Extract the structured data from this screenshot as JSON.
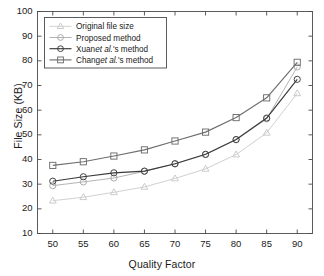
{
  "chart_data": {
    "type": "line",
    "title": "",
    "xlabel": "Quality Factor",
    "ylabel": "File Size (KB)",
    "x": [
      50,
      55,
      60,
      65,
      70,
      75,
      80,
      85,
      90
    ],
    "xticks": [
      "50",
      "55",
      "60",
      "65",
      "70",
      "75",
      "80",
      "85",
      "90"
    ],
    "yticks": [
      "10",
      "20",
      "30",
      "40",
      "50",
      "60",
      "70",
      "80",
      "90",
      "100"
    ],
    "xlim": [
      47.5,
      92.5
    ],
    "ylim": [
      10,
      100
    ],
    "grid": false,
    "legend_position": "upper-left-inside",
    "series": [
      {
        "name": "Original file size",
        "marker": "triangle",
        "color": "#c8c8c8",
        "values": [
          23.3,
          24.7,
          26.7,
          28.9,
          32.3,
          36.2,
          42.0,
          50.8,
          66.8
        ]
      },
      {
        "name": "Proposed method",
        "marker": "circle",
        "color": "#a6a6a6",
        "values": [
          29.4,
          30.9,
          32.5,
          35.2,
          38.2,
          42.0,
          48.0,
          56.5,
          77.5
        ]
      },
      {
        "name": "Xuan et al.'s method",
        "marker": "circle",
        "color": "#3a3a3a",
        "values": [
          31.2,
          33.0,
          34.6,
          35.3,
          38.3,
          42.1,
          48.1,
          56.8,
          72.5
        ]
      },
      {
        "name": "Chang et al.'s method",
        "marker": "square",
        "color": "#6e6e6e",
        "values": [
          37.6,
          39.1,
          41.4,
          43.9,
          47.5,
          51.1,
          57.0,
          65.0,
          79.4
        ]
      }
    ]
  },
  "legend": {
    "items": [
      {
        "label": "Original file size",
        "label_pre": "Original file size",
        "label_it": "",
        "label_post": ""
      },
      {
        "label": "Proposed method",
        "label_pre": "Proposed method",
        "label_it": "",
        "label_post": ""
      },
      {
        "label": "Xuan et al.'s method",
        "label_pre": "Xuan",
        "label_it": "et al.",
        "label_post": "'s method"
      },
      {
        "label": "Chang et al.'s method",
        "label_pre": "Chang",
        "label_it": "et al.",
        "label_post": "'s method"
      }
    ]
  },
  "axes": {
    "x_title": "Quality Factor",
    "y_title": "File Size (KB)"
  },
  "colors": {
    "axis": "#4a4a4a",
    "text": "#1a1a1a",
    "background": "#ffffff"
  }
}
